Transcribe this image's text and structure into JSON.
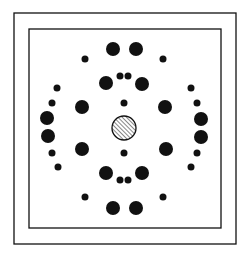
{
  "diagram": {
    "type": "diffraction-spot-pattern",
    "colors": {
      "background": "#ffffff",
      "ink": "#111111"
    },
    "outer_frame": {
      "x": 14,
      "y": 13,
      "w": 222,
      "h": 231
    },
    "inner_frame": {
      "x": 29,
      "y": 29,
      "w": 192,
      "h": 199
    },
    "center_beam": {
      "cx": 124,
      "cy": 128,
      "r": 12,
      "fill": "hatched"
    },
    "spots": [
      {
        "cx": 113,
        "cy": 49,
        "r": 7
      },
      {
        "cx": 136,
        "cy": 49,
        "r": 7
      },
      {
        "cx": 85,
        "cy": 59,
        "r": 3.5
      },
      {
        "cx": 163,
        "cy": 59,
        "r": 3.5
      },
      {
        "cx": 120,
        "cy": 76,
        "r": 3.5
      },
      {
        "cx": 128,
        "cy": 76,
        "r": 3.5
      },
      {
        "cx": 106,
        "cy": 83,
        "r": 7
      },
      {
        "cx": 142,
        "cy": 84,
        "r": 7
      },
      {
        "cx": 57,
        "cy": 88,
        "r": 3.5
      },
      {
        "cx": 191,
        "cy": 88,
        "r": 3.5
      },
      {
        "cx": 52,
        "cy": 103,
        "r": 3.5
      },
      {
        "cx": 197,
        "cy": 103,
        "r": 3.5
      },
      {
        "cx": 124,
        "cy": 103,
        "r": 3.5
      },
      {
        "cx": 82,
        "cy": 107,
        "r": 7
      },
      {
        "cx": 165,
        "cy": 107,
        "r": 7
      },
      {
        "cx": 47,
        "cy": 118,
        "r": 7
      },
      {
        "cx": 201,
        "cy": 119,
        "r": 7
      },
      {
        "cx": 48,
        "cy": 136,
        "r": 7
      },
      {
        "cx": 201,
        "cy": 137,
        "r": 7
      },
      {
        "cx": 82,
        "cy": 149,
        "r": 7
      },
      {
        "cx": 166,
        "cy": 149,
        "r": 7
      },
      {
        "cx": 52,
        "cy": 153,
        "r": 3.5
      },
      {
        "cx": 197,
        "cy": 153,
        "r": 3.5
      },
      {
        "cx": 124,
        "cy": 153,
        "r": 3.5
      },
      {
        "cx": 58,
        "cy": 167,
        "r": 3.5
      },
      {
        "cx": 191,
        "cy": 167,
        "r": 3.5
      },
      {
        "cx": 106,
        "cy": 173,
        "r": 7
      },
      {
        "cx": 142,
        "cy": 173,
        "r": 7
      },
      {
        "cx": 120,
        "cy": 180,
        "r": 3.5
      },
      {
        "cx": 128,
        "cy": 180,
        "r": 3.5
      },
      {
        "cx": 85,
        "cy": 197,
        "r": 3.5
      },
      {
        "cx": 163,
        "cy": 197,
        "r": 3.5
      },
      {
        "cx": 113,
        "cy": 208,
        "r": 7
      },
      {
        "cx": 136,
        "cy": 208,
        "r": 7
      }
    ]
  }
}
